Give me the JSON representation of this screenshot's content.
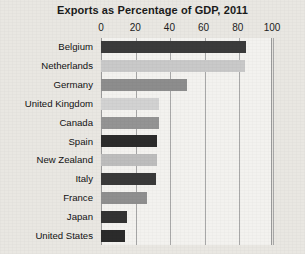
{
  "chart_data": {
    "type": "bar",
    "orientation": "horizontal",
    "title": "Exports as Percentage of GDP, 2011",
    "xlabel": "",
    "ylabel": "",
    "xlim": [
      0,
      100
    ],
    "xticks": [
      0,
      20,
      40,
      60,
      80,
      100
    ],
    "xtick_labels": [
      "0",
      "20",
      "40",
      "60",
      "80",
      "100"
    ],
    "grid": true,
    "legend": "none",
    "categories": [
      "Belgium",
      "Netherlands",
      "Germany",
      "United Kingdom",
      "Canada",
      "Spain",
      "New Zealand",
      "Italy",
      "France",
      "Japan",
      "United States"
    ],
    "values": [
      85,
      84,
      50,
      34,
      34,
      33,
      33,
      32,
      27,
      15,
      14
    ],
    "bar_colors": [
      "#3b3b3b",
      "#c9c9c9",
      "#8d8d8d",
      "#d2d2d2",
      "#949494",
      "#2c2c2c",
      "#bdbdbd",
      "#3a3a3a",
      "#8f8f8f",
      "#333333",
      "#2b2b2b"
    ]
  },
  "figure": {
    "background_color": "#e9e7e2",
    "plot_background_color": "#f3f2ef",
    "gridline_color": "#a8a8a8",
    "axis_color": "#9a9a9a",
    "text_color": "#1b1b1b"
  }
}
